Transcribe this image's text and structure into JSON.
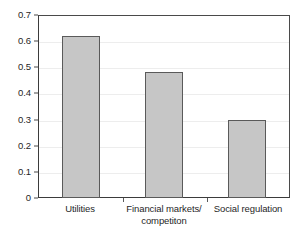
{
  "chart_data": {
    "type": "bar",
    "title": "",
    "subtitle": "",
    "xlabel": "",
    "ylabel": "",
    "categories": [
      "Utilities",
      "Financial markets/ competiton",
      "Social regulation"
    ],
    "category_lines": [
      [
        "Utilities"
      ],
      [
        "Financial markets/",
        "competiton"
      ],
      [
        "Social regulation"
      ]
    ],
    "values": [
      0.625,
      0.485,
      0.3
    ],
    "ylim": [
      0,
      0.7
    ],
    "ytick_values": [
      0.7,
      0.6,
      0.5,
      0.4,
      0.3,
      0.2,
      0.1,
      0
    ],
    "ytick_labels": [
      "0.7",
      "0.6",
      "0.5",
      "0.4",
      "0.3",
      "0.2",
      "0.1",
      "0"
    ],
    "grid": true,
    "grid_axis": "y",
    "legend": false,
    "legend_position": "none",
    "bar_fill_color": "#c6c6c6",
    "bar_border_color": "#5a5a5a",
    "axis_color": "#3b3b3b",
    "gridline_color": "#ededed",
    "background_color": "#ffffff",
    "text_color": "#1f1f1f"
  }
}
